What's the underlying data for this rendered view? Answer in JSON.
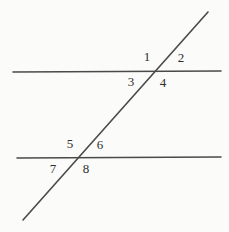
{
  "figure": {
    "name": "parallel-lines-transversal-diagram",
    "width": 229,
    "height": 232,
    "background_color": "#fbfbf9",
    "line_color": "#4a4a4a",
    "label_color": "#2e2e2e",
    "line_width": 1.6
  },
  "geometry": {
    "line_top": {
      "label": "upper-parallel-line",
      "x1": 13,
      "y1": 72,
      "x2": 221,
      "y2": 71
    },
    "line_bottom": {
      "label": "lower-parallel-line",
      "x1": 17,
      "y1": 158,
      "x2": 221,
      "y2": 157
    },
    "transversal": {
      "label": "transversal-line",
      "x1": 23,
      "y1": 220,
      "x2": 208,
      "y2": 12
    },
    "intersection_top": {
      "x": 156,
      "y": 72
    },
    "intersection_bottom": {
      "x": 73,
      "y": 158
    }
  },
  "labels": [
    {
      "text": "1",
      "x": 147,
      "y": 56,
      "position": "upper-intersection-top-left"
    },
    {
      "text": "2",
      "x": 181,
      "y": 57,
      "position": "upper-intersection-top-right"
    },
    {
      "text": "3",
      "x": 131,
      "y": 81,
      "position": "upper-intersection-bottom-left"
    },
    {
      "text": "4",
      "x": 163,
      "y": 82,
      "position": "upper-intersection-bottom-right"
    },
    {
      "text": "5",
      "x": 70,
      "y": 143,
      "position": "lower-intersection-top-left"
    },
    {
      "text": "6",
      "x": 100,
      "y": 144,
      "position": "lower-intersection-top-right"
    },
    {
      "text": "7",
      "x": 53,
      "y": 168,
      "position": "lower-intersection-bottom-left"
    },
    {
      "text": "8",
      "x": 86,
      "y": 168,
      "position": "lower-intersection-bottom-right"
    }
  ]
}
